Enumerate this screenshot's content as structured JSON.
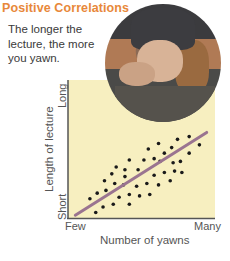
{
  "header": {
    "title": "Positive Correlations",
    "caption": "The longer the lecture, the more you yawn."
  },
  "photo": {
    "description": "person-yawning-photo"
  },
  "colors": {
    "title": "#e8883a",
    "plot_background": "#f7efc0",
    "trend_line": "#9a7490",
    "dots": "#1a1a1a",
    "axis": "#555555"
  },
  "chart_data": {
    "type": "scatter",
    "title": "Positive Correlations",
    "xlabel": "Number of yawns",
    "ylabel": "Length of lecture",
    "x_tick_labels": [
      "Few",
      "Many"
    ],
    "y_tick_labels": [
      "Short",
      "Long"
    ],
    "xlim": [
      0,
      100
    ],
    "ylim": [
      0,
      100
    ],
    "grid": false,
    "legend": null,
    "trend_line": {
      "x": [
        5,
        95
      ],
      "y": [
        2,
        62
      ]
    },
    "points": [
      {
        "x": 15,
        "y": 14
      },
      {
        "x": 20,
        "y": 18
      },
      {
        "x": 19,
        "y": 4
      },
      {
        "x": 25,
        "y": 27
      },
      {
        "x": 26,
        "y": 20
      },
      {
        "x": 24,
        "y": 8
      },
      {
        "x": 30,
        "y": 32
      },
      {
        "x": 33,
        "y": 37
      },
      {
        "x": 32,
        "y": 25
      },
      {
        "x": 31,
        "y": 10
      },
      {
        "x": 35,
        "y": 15
      },
      {
        "x": 39,
        "y": 35
      },
      {
        "x": 39,
        "y": 30
      },
      {
        "x": 38,
        "y": 24
      },
      {
        "x": 42,
        "y": 17
      },
      {
        "x": 42,
        "y": 10
      },
      {
        "x": 42,
        "y": 42
      },
      {
        "x": 48,
        "y": 35
      },
      {
        "x": 47,
        "y": 23
      },
      {
        "x": 49,
        "y": 16
      },
      {
        "x": 52,
        "y": 42
      },
      {
        "x": 55,
        "y": 50
      },
      {
        "x": 54,
        "y": 25
      },
      {
        "x": 56,
        "y": 17
      },
      {
        "x": 59,
        "y": 43
      },
      {
        "x": 59,
        "y": 31
      },
      {
        "x": 62,
        "y": 54
      },
      {
        "x": 62,
        "y": 24
      },
      {
        "x": 63,
        "y": 41
      },
      {
        "x": 66,
        "y": 47
      },
      {
        "x": 66,
        "y": 33
      },
      {
        "x": 70,
        "y": 27
      },
      {
        "x": 71,
        "y": 51
      },
      {
        "x": 72,
        "y": 40
      },
      {
        "x": 73,
        "y": 34
      },
      {
        "x": 75,
        "y": 57
      },
      {
        "x": 77,
        "y": 41
      },
      {
        "x": 78,
        "y": 33
      },
      {
        "x": 83,
        "y": 59
      },
      {
        "x": 83,
        "y": 47
      },
      {
        "x": 90,
        "y": 53
      }
    ]
  }
}
